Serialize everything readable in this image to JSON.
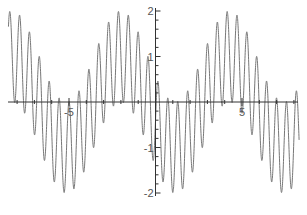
{
  "chart_data": {
    "type": "line",
    "title": "",
    "xlabel": "",
    "ylabel": "",
    "function": "sin(11x) + cos(x + 2)",
    "xlim": [
      -8.5,
      8.3
    ],
    "ylim": [
      -2.1,
      2.1
    ],
    "grid": false,
    "legend": null,
    "x_ticks": [
      {
        "value": -5,
        "label": "-5"
      },
      {
        "value": 5,
        "label": "5"
      }
    ],
    "y_ticks": [
      {
        "value": 2,
        "label": "2"
      },
      {
        "value": 1,
        "label": "1"
      },
      {
        "value": -1,
        "label": "-1"
      },
      {
        "value": -2,
        "label": "-2"
      }
    ],
    "series": [
      {
        "name": "f(x)",
        "color": "#777777",
        "carrier_frequency": 11,
        "carrier_amplitude": 1,
        "envelope_term": "cos(x + 2)",
        "sample_points": [
          {
            "x": -8.3,
            "y": 1.96
          },
          {
            "x": -5.0,
            "y": -1.98
          },
          {
            "x": -2.0,
            "y": 1.99
          },
          {
            "x": 1.2,
            "y": -1.98
          },
          {
            "x": 4.3,
            "y": 1.99
          },
          {
            "x": 7.5,
            "y": -1.96
          }
        ]
      }
    ],
    "colors": {
      "axis": "#333333",
      "line": "#777777",
      "background": "#ffffff"
    }
  }
}
